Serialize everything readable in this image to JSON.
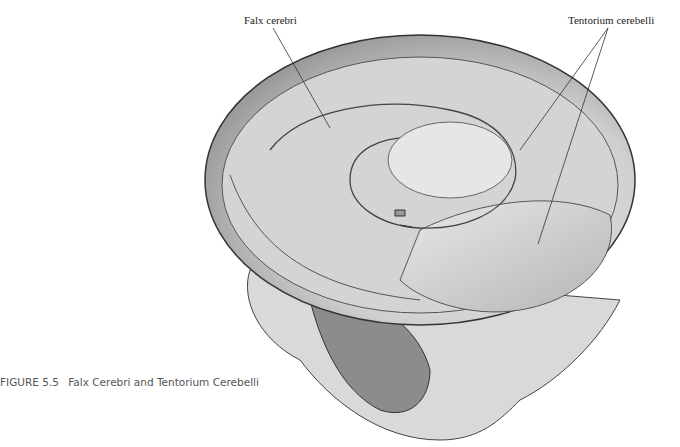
{
  "figure": {
    "number": "FIGURE 5.5",
    "title": "Falx Cerebri and Tentorium Cerebelli"
  },
  "labels": {
    "falx": "Falx cerebri",
    "tentorium": "Tentorium cerebelli"
  }
}
